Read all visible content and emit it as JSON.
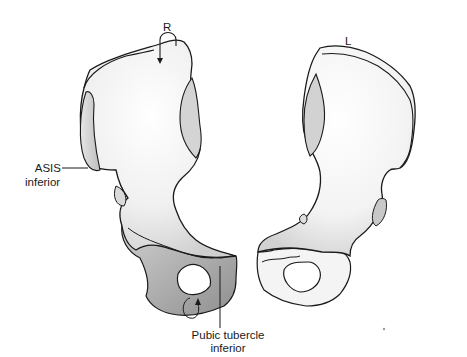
{
  "figure": {
    "side_labels": {
      "right": "R",
      "left": "L"
    },
    "annotations": {
      "asis": {
        "line1": "ASIS",
        "line2": "inferior"
      },
      "pubic_tubercle": {
        "line1": "Pubic tubercle",
        "line2": "inferior"
      }
    },
    "colors": {
      "outline": "#1a1a1a",
      "bone_fill": "#f2f2f2",
      "bone_shade": "#c8c8c8",
      "dark_shade": "#9a9a9a",
      "background": "#ffffff"
    }
  }
}
